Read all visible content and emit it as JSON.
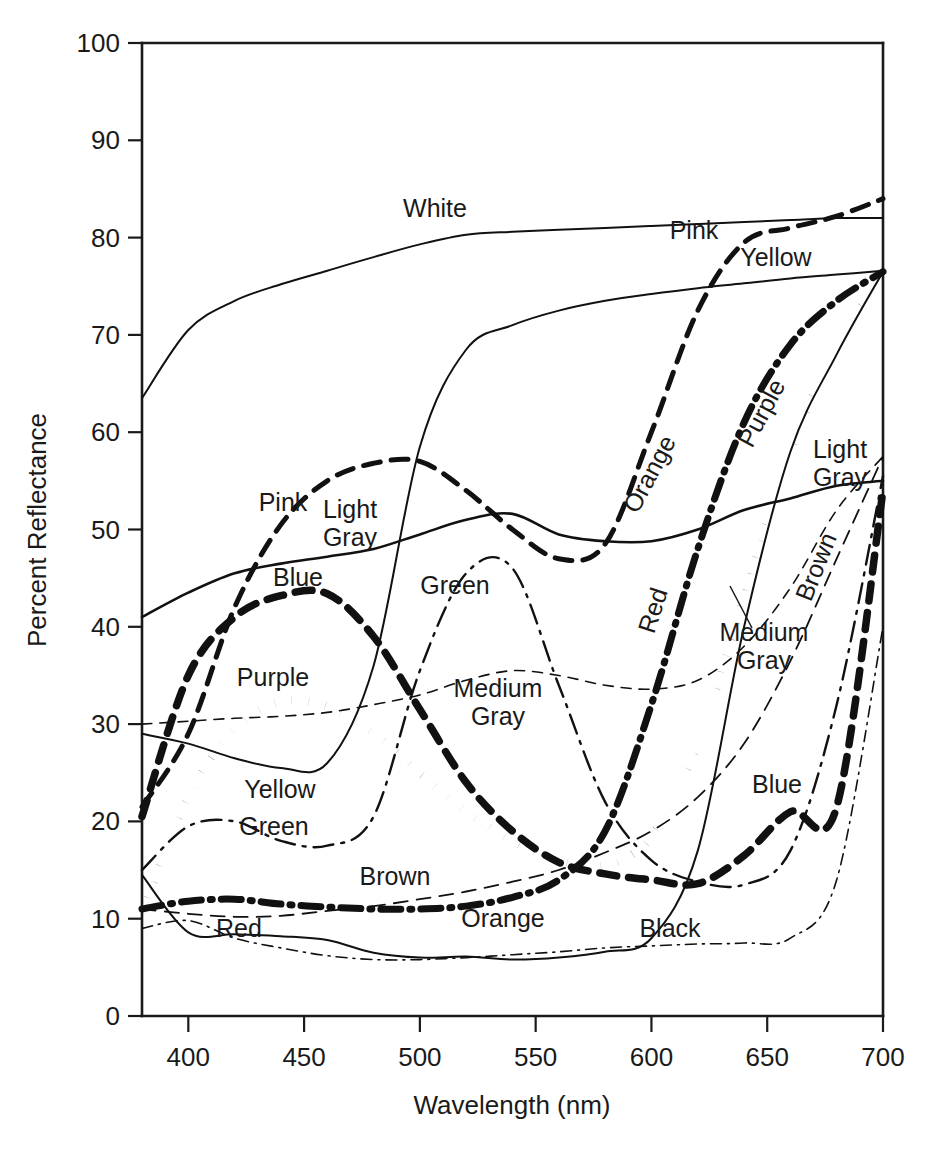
{
  "chart_data": {
    "type": "line",
    "title": "",
    "xlabel": "Wavelength (nm)",
    "ylabel": "Percent Reflectance",
    "xlim": [
      380,
      700
    ],
    "ylim": [
      0,
      100
    ],
    "xticks": [
      400,
      450,
      500,
      550,
      600,
      650,
      700
    ],
    "yticks": [
      0,
      10,
      20,
      30,
      40,
      50,
      60,
      70,
      80,
      90,
      100
    ],
    "grid": false,
    "legend": "inline-labels",
    "x": [
      380,
      400,
      420,
      440,
      460,
      480,
      500,
      520,
      540,
      560,
      580,
      600,
      620,
      640,
      660,
      680,
      700
    ],
    "series": [
      {
        "name": "White",
        "label": "White",
        "style": "thin-solid",
        "values": [
          63.5,
          70.5,
          73.5,
          75.2,
          76.6,
          78.0,
          79.3,
          80.3,
          80.6,
          80.8,
          81.0,
          81.2,
          81.4,
          81.6,
          81.8,
          82.0,
          82.0
        ]
      },
      {
        "name": "Pink",
        "label": "Pink",
        "style": "bold-dash",
        "values": [
          21.5,
          29.0,
          42.0,
          50.5,
          55.0,
          56.8,
          57.0,
          54.0,
          50.0,
          47.0,
          48.5,
          60.0,
          72.5,
          79.5,
          81.0,
          82.2,
          84.0
        ]
      },
      {
        "name": "Yellow",
        "label": "Yellow",
        "style": "thin-solid",
        "values": [
          29.0,
          28.0,
          26.5,
          25.5,
          26.0,
          36.0,
          58.5,
          68.5,
          71.0,
          72.5,
          73.5,
          74.2,
          74.8,
          75.3,
          75.8,
          76.2,
          76.6
        ]
      },
      {
        "name": "Light Gray",
        "label": "Light Gray",
        "style": "medium-solid",
        "values": [
          41.0,
          43.5,
          45.5,
          46.5,
          47.2,
          48.0,
          49.5,
          51.0,
          51.6,
          49.5,
          48.8,
          48.8,
          50.0,
          52.0,
          53.2,
          54.5,
          55.0
        ]
      },
      {
        "name": "Medium Gray",
        "label": "Medium Gray",
        "style": "thin-fine-dash",
        "values": [
          30.0,
          30.3,
          30.6,
          30.8,
          31.2,
          32.0,
          33.0,
          34.5,
          35.5,
          35.0,
          34.0,
          33.6,
          34.5,
          38.0,
          44.0,
          52.0,
          57.5
        ]
      },
      {
        "name": "Blue",
        "label": "Blue",
        "style": "bold-dash-2",
        "values": [
          20.5,
          35.0,
          41.0,
          43.2,
          43.4,
          39.0,
          31.5,
          24.0,
          19.0,
          15.8,
          14.6,
          14.0,
          13.6,
          16.5,
          21.0,
          21.5,
          54.0
        ]
      },
      {
        "name": "Purple",
        "label": "Purple",
        "style": "bold-dot",
        "values": [
          10.5,
          22.5,
          29.5,
          32.3,
          31.8,
          29.0,
          25.0,
          21.0,
          18.0,
          16.0,
          15.5,
          18.5,
          28.0,
          43.0,
          58.0,
          69.0,
          76.0
        ]
      },
      {
        "name": "Green",
        "label": "Green",
        "style": "thin-dashdot",
        "values": [
          15.0,
          19.5,
          20.0,
          18.0,
          17.5,
          20.5,
          35.5,
          45.5,
          46.0,
          34.0,
          22.0,
          16.0,
          13.8,
          13.5,
          17.0,
          32.0,
          55.5
        ]
      },
      {
        "name": "Brown",
        "label": "Brown",
        "style": "thin-dash",
        "values": [
          11.0,
          10.5,
          10.2,
          10.3,
          10.8,
          11.3,
          12.0,
          12.8,
          13.8,
          15.0,
          16.8,
          19.0,
          22.5,
          28.0,
          36.5,
          47.0,
          57.5
        ]
      },
      {
        "name": "Orange",
        "label": "Orange",
        "style": "bold-dashdot",
        "values": [
          11.0,
          11.8,
          12.0,
          11.5,
          11.2,
          11.0,
          11.0,
          11.3,
          12.2,
          14.0,
          19.0,
          32.0,
          48.0,
          61.0,
          69.0,
          73.5,
          76.5
        ]
      },
      {
        "name": "Red",
        "label": "Red",
        "style": "thin-solid",
        "values": [
          14.5,
          8.6,
          8.4,
          8.2,
          7.8,
          6.5,
          6.0,
          6.1,
          5.8,
          6.0,
          6.6,
          8.0,
          17.0,
          40.0,
          58.0,
          68.0,
          76.5
        ]
      },
      {
        "name": "Black",
        "label": "Black",
        "style": "fine-dashdot",
        "values": [
          9.0,
          9.8,
          8.0,
          7.0,
          6.2,
          5.8,
          5.8,
          6.0,
          6.3,
          6.6,
          7.0,
          7.2,
          7.4,
          7.5,
          8.0,
          14.0,
          40.0
        ]
      }
    ],
    "inline_labels": [
      {
        "text": "White",
        "x": 435,
        "y": 217,
        "rotate": 0
      },
      {
        "text": "Pink",
        "x": 694,
        "y": 239,
        "rotate": 0
      },
      {
        "text": "Yellow",
        "x": 776,
        "y": 266,
        "rotate": 0
      },
      {
        "text": "Pink",
        "x": 283,
        "y": 511,
        "rotate": 0
      },
      {
        "text": "Light",
        "x": 350,
        "y": 518,
        "rotate": 0
      },
      {
        "text": "Gray",
        "x": 350,
        "y": 546,
        "rotate": 0
      },
      {
        "text": "Blue",
        "x": 298,
        "y": 586,
        "rotate": 0
      },
      {
        "text": "Green",
        "x": 455,
        "y": 594,
        "rotate": 0
      },
      {
        "text": "Purple",
        "x": 273,
        "y": 686,
        "rotate": 0
      },
      {
        "text": "Medium",
        "x": 498,
        "y": 697,
        "rotate": 0
      },
      {
        "text": "Gray",
        "x": 498,
        "y": 725,
        "rotate": 0
      },
      {
        "text": "Yellow",
        "x": 280,
        "y": 798,
        "rotate": 0
      },
      {
        "text": "Green",
        "x": 274,
        "y": 835,
        "rotate": 0
      },
      {
        "text": "Brown",
        "x": 395,
        "y": 885,
        "rotate": 0
      },
      {
        "text": "Orange",
        "x": 503,
        "y": 927,
        "rotate": 0
      },
      {
        "text": "Red",
        "x": 239,
        "y": 937,
        "rotate": 0
      },
      {
        "text": "Black",
        "x": 670,
        "y": 937,
        "rotate": 0
      },
      {
        "text": "Orange",
        "x": 657,
        "y": 478,
        "rotate": -62
      },
      {
        "text": "Purple",
        "x": 769,
        "y": 417,
        "rotate": -62
      },
      {
        "text": "Light",
        "x": 840,
        "y": 458,
        "rotate": 0
      },
      {
        "text": "Gray",
        "x": 840,
        "y": 486,
        "rotate": 0
      },
      {
        "text": "Red",
        "x": 661,
        "y": 613,
        "rotate": -72
      },
      {
        "text": "Medium",
        "x": 764,
        "y": 641,
        "rotate": 0
      },
      {
        "text": "Gray",
        "x": 764,
        "y": 669,
        "rotate": 0
      },
      {
        "text": "Brown",
        "x": 824,
        "y": 570,
        "rotate": -68
      },
      {
        "text": "Blue",
        "x": 777,
        "y": 793,
        "rotate": 0
      }
    ]
  }
}
